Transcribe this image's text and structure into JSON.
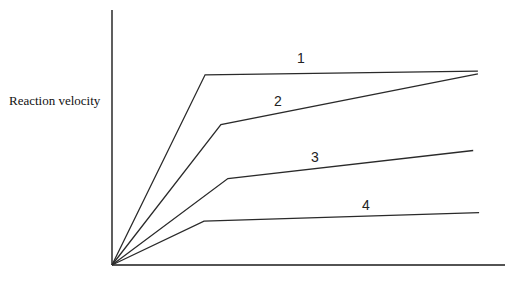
{
  "chart_data": {
    "type": "line",
    "title": "",
    "ylabel": "Reaction velocity",
    "xlabel": "",
    "grid": false,
    "legend": "inline numeric labels on lines",
    "axis_ranges": {
      "x": [
        0,
        100
      ],
      "y": [
        0,
        100
      ]
    },
    "series": [
      {
        "name": "1",
        "points": [
          [
            0,
            0
          ],
          [
            23.7,
            74.6
          ],
          [
            93.1,
            76.0
          ]
        ]
      },
      {
        "name": "2",
        "points": [
          [
            0,
            0
          ],
          [
            27.7,
            55.1
          ],
          [
            93.1,
            75.0
          ]
        ]
      },
      {
        "name": "3",
        "points": [
          [
            0,
            0
          ],
          [
            29.5,
            33.9
          ],
          [
            91.9,
            44.9
          ]
        ]
      },
      {
        "name": "4",
        "points": [
          [
            0,
            0
          ],
          [
            23.4,
            17.2
          ],
          [
            93.4,
            20.5
          ]
        ]
      }
    ],
    "annotations": [
      "1",
      "2",
      "3",
      "4"
    ]
  },
  "labels": {
    "y_axis": "Reaction velocity",
    "x_axis": "",
    "line_1": "1",
    "line_2": "2",
    "line_3": "3",
    "line_4": "4"
  }
}
